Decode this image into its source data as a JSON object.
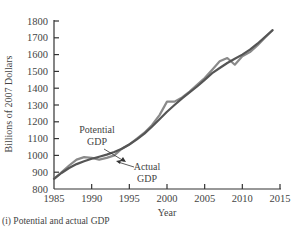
{
  "caption": "(i) Potential and actual GDP",
  "chart_data": {
    "type": "line",
    "title": "",
    "xlabel": "Year",
    "ylabel": "Billions of 2007 Dollars",
    "xlim": [
      1985,
      2015
    ],
    "ylim": [
      800,
      1800
    ],
    "x_ticks": [
      1985,
      1990,
      1995,
      2000,
      2005,
      2010,
      2015
    ],
    "y_ticks": [
      800,
      900,
      1000,
      1100,
      1200,
      1300,
      1400,
      1500,
      1600,
      1700,
      1800
    ],
    "grid": false,
    "legend": "none (inline annotations)",
    "annotations": [
      {
        "text": "Potential GDP",
        "line1": "Potential",
        "line2": "GDP",
        "points_to_year": 1992
      },
      {
        "text": "Actual GDP",
        "line1": "Actual",
        "line2": "GDP",
        "points_to_year": 1992
      }
    ],
    "series": [
      {
        "name": "Potential GDP",
        "color": "#555555",
        "x": [
          1985,
          1986,
          1987,
          1988,
          1989,
          1990,
          1991,
          1992,
          1993,
          1994,
          1995,
          1996,
          1997,
          1998,
          1999,
          2000,
          2001,
          2002,
          2003,
          2004,
          2005,
          2006,
          2007,
          2008,
          2009,
          2010,
          2011,
          2012,
          2013,
          2014
        ],
        "values": [
          860,
          895,
          925,
          948,
          965,
          980,
          992,
          1005,
          1020,
          1040,
          1065,
          1095,
          1130,
          1170,
          1215,
          1260,
          1300,
          1340,
          1375,
          1410,
          1450,
          1490,
          1520,
          1550,
          1575,
          1600,
          1630,
          1665,
          1705,
          1745
        ]
      },
      {
        "name": "Actual GDP",
        "color": "#8a8a8a",
        "x": [
          1985,
          1986,
          1987,
          1988,
          1989,
          1990,
          1991,
          1992,
          1993,
          1994,
          1995,
          1996,
          1997,
          1998,
          1999,
          2000,
          2001,
          2002,
          2003,
          2004,
          2005,
          2006,
          2007,
          2008,
          2009,
          2010,
          2011,
          2012,
          2013,
          2014
        ],
        "values": [
          860,
          900,
          940,
          975,
          990,
          985,
          975,
          985,
          1000,
          1040,
          1065,
          1100,
          1135,
          1180,
          1240,
          1320,
          1320,
          1345,
          1380,
          1420,
          1460,
          1510,
          1560,
          1580,
          1540,
          1590,
          1615,
          1655,
          1700,
          1745
        ]
      }
    ]
  }
}
